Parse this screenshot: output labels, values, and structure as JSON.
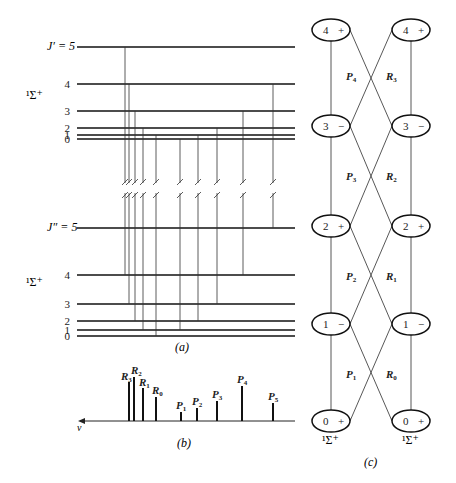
{
  "panel_a": {
    "caption": "(a)",
    "upper_state_label": "¹Σ⁺",
    "lower_state_label": "¹Σ⁺",
    "upper_top_label": "J′ = 5",
    "lower_top_label": "J″ = 5",
    "upper_levels": [
      {
        "J": "5",
        "y": 47
      },
      {
        "J": "4",
        "y": 84
      },
      {
        "J": "3",
        "y": 111
      },
      {
        "J": "2",
        "y": 128
      },
      {
        "J": "1",
        "y": 135
      },
      {
        "J": "0",
        "y": 139
      }
    ],
    "lower_levels": [
      {
        "J": "5",
        "y": 228
      },
      {
        "J": "4",
        "y": 275
      },
      {
        "J": "3",
        "y": 304
      },
      {
        "J": "2",
        "y": 321
      },
      {
        "J": "1",
        "y": 330
      },
      {
        "J": "0",
        "y": 336
      }
    ],
    "transitions": [
      {
        "x": 125,
        "from_J": 5,
        "to_J": 4
      },
      {
        "x": 129,
        "from_J": 4,
        "to_J": 3
      },
      {
        "x": 135,
        "from_J": 3,
        "to_J": 2
      },
      {
        "x": 143,
        "from_J": 2,
        "to_J": 1
      },
      {
        "x": 156,
        "from_J": 1,
        "to_J": 0
      },
      {
        "x": 180,
        "from_J": 0,
        "to_J": 1
      },
      {
        "x": 198,
        "from_J": 1,
        "to_J": 2
      },
      {
        "x": 217,
        "from_J": 2,
        "to_J": 3
      },
      {
        "x": 243,
        "from_J": 3,
        "to_J": 4
      },
      {
        "x": 273,
        "from_J": 4,
        "to_J": 5
      }
    ]
  },
  "panel_b": {
    "caption": "(b)",
    "axis_label": "ν",
    "lines": [
      {
        "label": "R",
        "sub": "3",
        "x": 129,
        "top": 382
      },
      {
        "label": "R",
        "sub": "2",
        "x": 134,
        "top": 377
      },
      {
        "label": "R",
        "sub": "1",
        "x": 143,
        "top": 388
      },
      {
        "label": "R",
        "sub": "0",
        "x": 156,
        "top": 397
      },
      {
        "label": "P",
        "sub": "1",
        "x": 181,
        "top": 412
      },
      {
        "label": "P",
        "sub": "2",
        "x": 197,
        "top": 408
      },
      {
        "label": "P",
        "sub": "3",
        "x": 217,
        "top": 401
      },
      {
        "label": "P",
        "sub": "4",
        "x": 242,
        "top": 386
      },
      {
        "label": "P",
        "sub": "5",
        "x": 273,
        "top": 403
      }
    ]
  },
  "panel_c": {
    "caption": "(c)",
    "left_state_label": "¹Σ⁺",
    "right_state_label": "¹Σ⁺",
    "levels": [
      {
        "J": "4",
        "parity": "+",
        "y": 30
      },
      {
        "J": "3",
        "parity": "−",
        "y": 126
      },
      {
        "J": "2",
        "parity": "+",
        "y": 226
      },
      {
        "J": "1",
        "parity": "−",
        "y": 324
      },
      {
        "J": "0",
        "parity": "+",
        "y": 421
      }
    ],
    "branch_labels": [
      {
        "label": "P",
        "sub": "4",
        "x": 346,
        "y": 80
      },
      {
        "label": "R",
        "sub": "3",
        "x": 386,
        "y": 80
      },
      {
        "label": "P",
        "sub": "3",
        "x": 346,
        "y": 180
      },
      {
        "label": "R",
        "sub": "2",
        "x": 386,
        "y": 180
      },
      {
        "label": "P",
        "sub": "2",
        "x": 346,
        "y": 280
      },
      {
        "label": "R",
        "sub": "1",
        "x": 386,
        "y": 280
      },
      {
        "label": "P",
        "sub": "1",
        "x": 346,
        "y": 378
      },
      {
        "label": "R",
        "sub": "0",
        "x": 386,
        "y": 378
      }
    ]
  }
}
